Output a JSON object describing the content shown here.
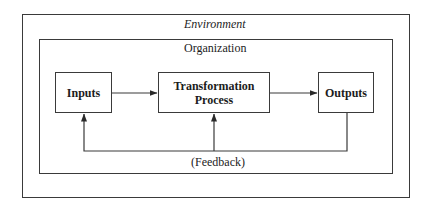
{
  "diagram": {
    "type": "systems-model",
    "environment": {
      "label": "Environment"
    },
    "organization": {
      "label": "Organization"
    },
    "nodes": [
      {
        "id": "inputs",
        "label": "Inputs"
      },
      {
        "id": "transformation",
        "label_line1": "Transformation",
        "label_line2": "Process"
      },
      {
        "id": "outputs",
        "label": "Outputs"
      }
    ],
    "edges": [
      {
        "from": "inputs",
        "to": "transformation"
      },
      {
        "from": "transformation",
        "to": "outputs"
      },
      {
        "from": "outputs",
        "to": "inputs",
        "type": "feedback"
      },
      {
        "from": "outputs",
        "to": "transformation",
        "type": "feedback"
      }
    ],
    "feedback_label": "(Feedback)",
    "colors": {
      "line": "#3a3a3a",
      "text": "#1c1c1c",
      "background": "#ffffff"
    }
  }
}
